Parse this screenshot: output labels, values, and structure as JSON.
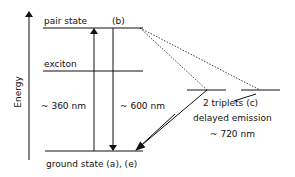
{
  "diagram": {
    "axis": {
      "label": "Energy"
    },
    "levels": {
      "pair_state": {
        "label": "pair state",
        "tag": "(b)"
      },
      "exciton": {
        "label": "exciton"
      },
      "ground_state": {
        "label": "ground state (a), (e)"
      },
      "triplets": {
        "label": "2 triplets (c)"
      }
    },
    "transitions": {
      "absorption": {
        "label": "~ 360 nm"
      },
      "emission": {
        "label": "~ 600 nm"
      },
      "delayed": {
        "label": "delayed emission",
        "wavelength": "~ 720 nm"
      }
    },
    "colors": {
      "line": "#111111",
      "background": "#ffffff"
    }
  }
}
